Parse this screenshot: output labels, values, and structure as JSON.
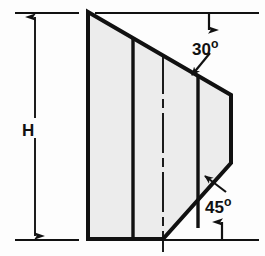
{
  "figure": {
    "type": "engineering-drawing",
    "background_color": "#fdfdfd",
    "line_color": "#111111",
    "fill_color": "#ececec"
  },
  "labels": {
    "height": {
      "text": "H",
      "name": "height-dimension-label"
    },
    "top_angle": {
      "value": "30",
      "unit": "o",
      "name": "top-angle-label"
    },
    "bottom_angle": {
      "value": "45",
      "unit": "o",
      "name": "bottom-angle-label"
    }
  },
  "geometry": {
    "outline_points": "88,12 231,95 231,163 163,239 88,239",
    "internal_lines": [
      {
        "name": "rib-line-1",
        "x1": 133,
        "y1": 38,
        "x2": 133,
        "y2": 239
      },
      {
        "name": "right-face-line",
        "x1": 198,
        "y1": 76,
        "x2": 198,
        "y2": 227
      }
    ],
    "centerline": {
      "name": "vertical-centerline",
      "x": 163,
      "y1": 55,
      "y2": 252
    },
    "reference_lines": [
      {
        "name": "top-reference-line",
        "x1": 96,
        "y1": 13,
        "x2": 258,
        "y2": 13
      },
      {
        "name": "bottom-reference-line",
        "x1": 163,
        "y1": 240,
        "x2": 258,
        "y2": 240
      },
      {
        "name": "upper-extension-line",
        "x1": 15,
        "y1": 13,
        "x2": 78,
        "y2": 13
      },
      {
        "name": "lower-extension-line",
        "x1": 15,
        "y1": 240,
        "x2": 78,
        "y2": 240
      }
    ],
    "dimension_line": {
      "name": "height-dimension-line",
      "x": 35,
      "y1": 16,
      "y2": 237
    },
    "leaders": [
      {
        "name": "top-angle-leader",
        "x1": 209,
        "y1": 52,
        "x2": 193,
        "y2": 74
      },
      {
        "name": "bottom-angle-leader",
        "x1": 224,
        "y1": 190,
        "x2": 206,
        "y2": 177
      }
    ],
    "pointer_arrows": [
      {
        "name": "top-pointer-arrow",
        "x": 209,
        "y_from": 13,
        "y_to": 30,
        "direction": "down"
      },
      {
        "name": "bottom-pointer-arrow",
        "x": 222,
        "y_from": 240,
        "y_to": 223,
        "direction": "up"
      }
    ]
  }
}
